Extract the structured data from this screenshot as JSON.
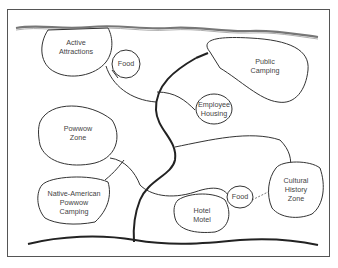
{
  "diagram": {
    "type": "site-plan bubble diagram",
    "zones": [
      {
        "id": "active-attractions",
        "lines": [
          "Active",
          "Attractions"
        ]
      },
      {
        "id": "food-top",
        "lines": [
          "Food"
        ]
      },
      {
        "id": "public-camping",
        "lines": [
          "Public",
          "Camping"
        ]
      },
      {
        "id": "employee-housing",
        "lines": [
          "Employee",
          "Housing"
        ]
      },
      {
        "id": "powwow-zone",
        "lines": [
          "Powwow",
          "Zone"
        ]
      },
      {
        "id": "native-american-camping",
        "lines": [
          "Native-American",
          "Powwow",
          "Camping"
        ]
      },
      {
        "id": "hotel-motel",
        "lines": [
          "Hotel",
          "Motel"
        ]
      },
      {
        "id": "food-bottom",
        "lines": [
          "Food"
        ]
      },
      {
        "id": "cultural-history-zone",
        "lines": [
          "Cultural",
          "History",
          "Zone"
        ]
      }
    ],
    "colors": {
      "line": "#333333",
      "text": "#444444",
      "background": "#ffffff"
    }
  }
}
